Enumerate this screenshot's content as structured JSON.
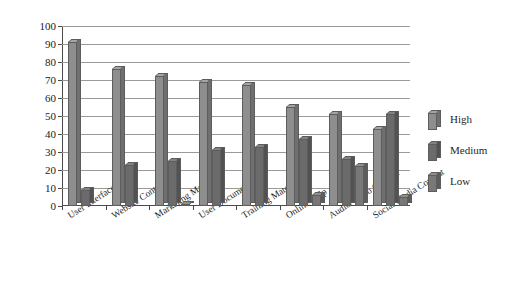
{
  "chart_data": {
    "type": "bar",
    "title": "",
    "subtitle": "",
    "xlabel": "",
    "ylabel": "",
    "ylim": [
      0,
      100
    ],
    "ytick_step": 10,
    "yticks": [
      100,
      90,
      80,
      70,
      60,
      50,
      40,
      30,
      20,
      10,
      0
    ],
    "grid": true,
    "grid_axis": "y",
    "legend_position": "right",
    "orientation": "vertical",
    "bar_style": "3d-column-clustered",
    "categories": [
      "User Interface Text",
      "Website Content",
      "Marketing Material",
      "User Documentation",
      "Training Material",
      "Online Help",
      "Audio/Video Content",
      "Social Media Content"
    ],
    "series": [
      {
        "name": "High",
        "color": "#8e8e8e",
        "values": [
          91,
          76,
          72,
          69,
          67,
          55,
          51,
          43
        ]
      },
      {
        "name": "Medium",
        "color": "#6b6b6b",
        "values": [
          9,
          23,
          25,
          31,
          33,
          37,
          26,
          51
        ]
      },
      {
        "name": "Low",
        "color": "#787878",
        "values": [
          0,
          0,
          1,
          0,
          0,
          6,
          22,
          5
        ]
      }
    ]
  },
  "legend": {
    "entries": [
      {
        "label": "High"
      },
      {
        "label": "Medium"
      },
      {
        "label": "Low"
      }
    ]
  },
  "colors": {
    "axis": "#4a4a4a",
    "grid": "#9a9a9a",
    "text": "#1f1f1f",
    "background": "#ffffff"
  }
}
